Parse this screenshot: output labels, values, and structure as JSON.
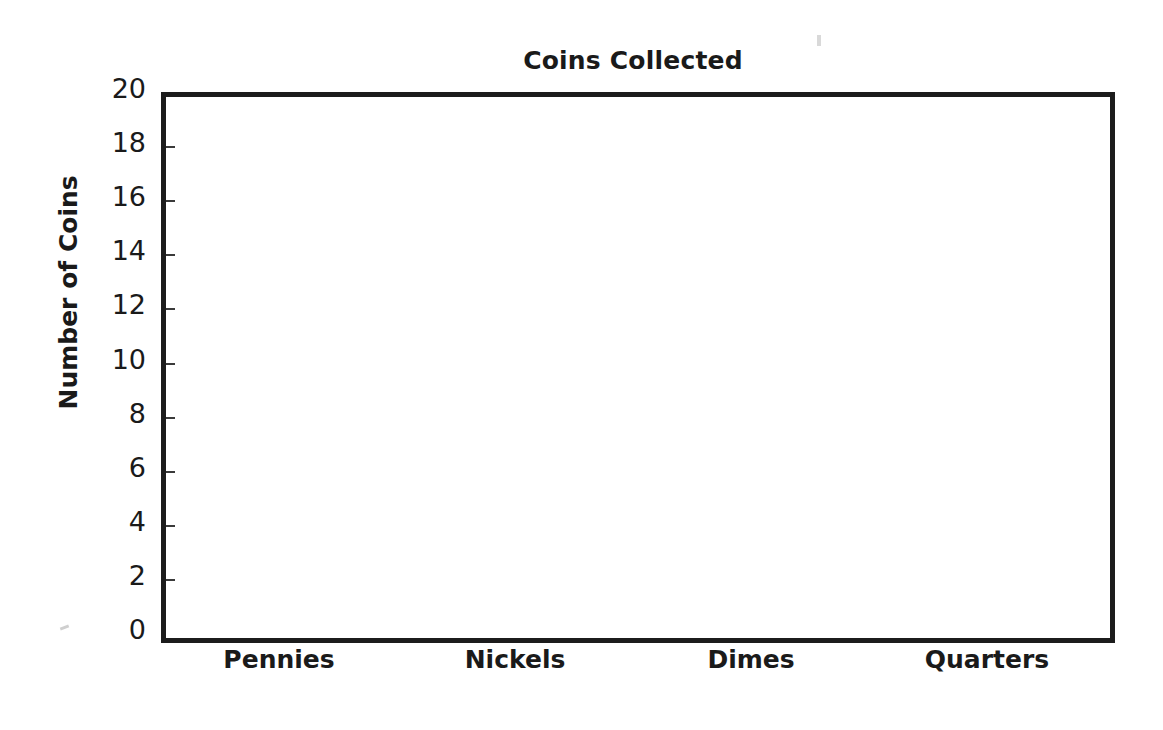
{
  "chart_data": {
    "type": "bar",
    "title": "Coins Collected",
    "xlabel": "",
    "ylabel": "Number of Coins",
    "categories": [
      "Pennies",
      "Nickels",
      "Dimes",
      "Quarters"
    ],
    "values": [
      15.1,
      10.0,
      18.3,
      15.2
    ],
    "ylim": [
      0,
      20
    ],
    "ytick_labels": [
      "0",
      "2",
      "4",
      "6",
      "8",
      "10",
      "12",
      "14",
      "16",
      "18",
      "20"
    ],
    "ytick_values": [
      0,
      2,
      4,
      6,
      8,
      10,
      12,
      14,
      16,
      18,
      20
    ],
    "grid": true,
    "grid_axis": "y",
    "legend": false,
    "bar_colors": [
      "#999999",
      "#6b6b6b",
      "#a9a9a9",
      "#5c5c5c"
    ],
    "axis_color": "#1c1c1c",
    "gridline_color": "#b9b9b9",
    "text_color": "#1a1a1a",
    "background": "#ffffff"
  }
}
